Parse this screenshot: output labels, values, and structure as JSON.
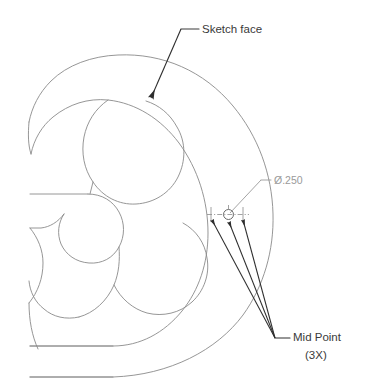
{
  "document": {
    "title": "Sketch face dimension drawing",
    "background_color": "#ffffff"
  },
  "style": {
    "geometry_color": "#8a8a8a",
    "annotation_color": "#3a3a3a",
    "dimension_color": "#9a9a9a",
    "geometry_stroke_width": 0.9,
    "leader_stroke_width": 1.0
  },
  "annotations": {
    "sketch_face": {
      "label": "Sketch face",
      "text_x": 202,
      "text_y": 32,
      "font_size": 11.5,
      "color": "#3a3a3a",
      "leader_shelf": {
        "x1": 181,
        "y1": 29,
        "x2": 198,
        "y2": 29
      },
      "leader_line": {
        "x1": 181,
        "y1": 29,
        "x2": 150,
        "y2": 99
      },
      "arrow_tip": {
        "x": 150,
        "y": 99
      },
      "arrow_angle_deg": 246
    },
    "diameter": {
      "label": "Ø.250",
      "text_x": 272,
      "text_y": 184,
      "font_size": 10.5,
      "color": "#9a9a9a",
      "leader_shelf": {
        "x1": 261,
        "y1": 180,
        "x2": 270,
        "y2": 180
      },
      "leader_line": {
        "x1": 261,
        "y1": 180,
        "x2": 230,
        "y2": 215
      }
    },
    "mid_point": {
      "label_line1": "Mid Point",
      "label_line2": "(3X)",
      "text_x": 292,
      "text_y1": 337,
      "text_y2": 355,
      "font_size": 11.5,
      "color": "#3a3a3a",
      "leader_shelf": {
        "x1": 275,
        "y1": 338,
        "x2": 289,
        "y2": 338
      },
      "origin": {
        "x": 275,
        "y": 338
      },
      "arrow_tips": [
        {
          "x": 211,
          "y": 219
        },
        {
          "x": 228,
          "y": 221
        },
        {
          "x": 243,
          "y": 219
        }
      ]
    }
  },
  "feature": {
    "hole": {
      "center_x": 228.5,
      "center_y": 214.5,
      "radius": 5.0,
      "centerline": {
        "x1": 209,
        "y1": 214.5,
        "x2": 248,
        "y2": 214.5
      }
    },
    "extension_lines": [
      {
        "x1": 211,
        "y1": 208,
        "x2": 211,
        "y2": 221
      },
      {
        "x1": 243,
        "y1": 208,
        "x2": 243,
        "y2": 221
      }
    ],
    "midpoint_ticks": [
      {
        "x": 211,
        "y": 214.5
      },
      {
        "x": 243,
        "y": 214.5
      }
    ]
  },
  "geometry": {
    "description": "C-shaped sketch profile with inner and outer offset contours and two lobes",
    "paths": {
      "outer_contour": "M 28,377 L 112,377 C 168,375 214,352 240,318 C 262,288 272,252 271,216 C 270,178 257,140 233,110 C 205,75 164,56 118,57 C 92,57 68,65 52,80 C 40,91 33,105 30,120 C 28,132 28,143 30,152",
      "inner_contour": "M 30,194 L 88,194 C 99,194 107,199 112,207 C 118,216 120,227 118,236 C 116,246 109,253 100,255 C 90,257 81,253 75,246 C 68,238 65,227 67,217 C 68,207 73,199 81,196",
      "mid_contour": "M 30,152 C 33,138 40,125 51,116 C 66,103 85,97 105,99 C 133,101 158,116 175,139 C 194,164 204,196 204,228 C 204,258 196,286 180,308 C 163,331 139,345 112,345 L 28,345",
      "lobe_upper": "M 108,99 C 96,108 88,121 85,136 C 82,151 84,166 91,179 C 99,193 112,202 127,204 C 144,206 160,199 170,186 C 180,172 183,154 178,138 C 174,123 164,110 151,103",
      "lobe_lower": "M 118,236 C 117,249 119,262 124,273 C 132,290 147,302 165,305 C 181,308 197,303 208,292 C 219,281 224,265 222,250 C 220,234 211,220 198,213",
      "notch_left": "M 30,194 L 30,152",
      "bottom_edge": "M 28,377 L 112,377"
    }
  }
}
